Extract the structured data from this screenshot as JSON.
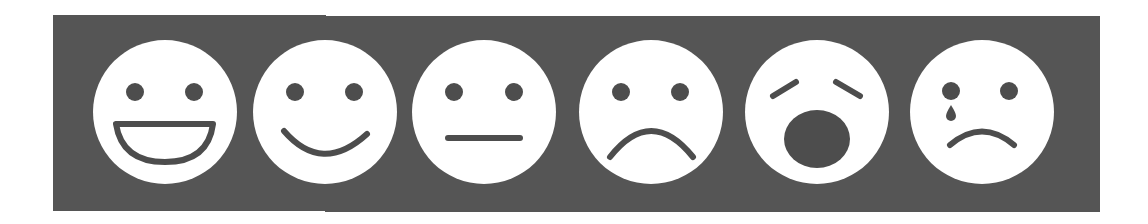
{
  "scale": {
    "panel_color": "#555555",
    "face_color": "#ffffff",
    "feature_color": "#4d4d4d",
    "faces": [
      {
        "id": "very-happy",
        "label": "Very happy (grinning)",
        "cx": 165,
        "cy": 112
      },
      {
        "id": "happy",
        "label": "Happy (smiling)",
        "cx": 325,
        "cy": 112
      },
      {
        "id": "neutral",
        "label": "Neutral",
        "cx": 484,
        "cy": 112
      },
      {
        "id": "sad",
        "label": "Sad (frowning)",
        "cx": 651,
        "cy": 112
      },
      {
        "id": "distressed",
        "label": "Distressed (open mouth)",
        "cx": 817,
        "cy": 112
      },
      {
        "id": "crying",
        "label": "Crying (tear)",
        "cx": 982,
        "cy": 112
      }
    ]
  }
}
